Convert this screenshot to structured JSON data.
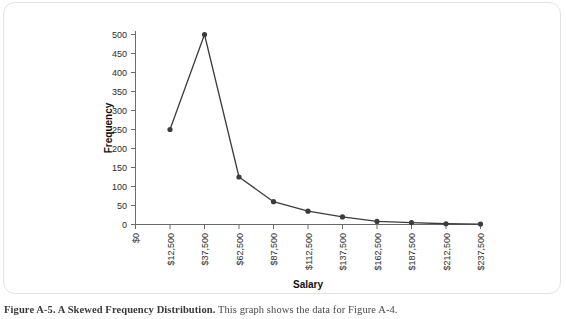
{
  "figure": {
    "caption_label": "Figure A-5.  A Skewed Frequency Distribution.",
    "caption_text": "  This graph shows the data for Figure A-4."
  },
  "chart_data": {
    "type": "line",
    "title": "",
    "xlabel": "Salary",
    "ylabel": "Frequency",
    "categories": [
      "$0",
      "$12,500",
      "$37,500",
      "$62,500",
      "$87,500",
      "$112,500",
      "$137,500",
      "$162,500",
      "$187,500",
      "$212,500",
      "$237,500"
    ],
    "x_tick_labels": [
      "$0",
      "$12,500",
      "$37,500",
      "$62,500",
      "$87,500",
      "$112,500",
      "$137,500",
      "$162,500",
      "$187,500",
      "$212,500",
      "$237,500"
    ],
    "y_tick_labels": [
      "0",
      "50",
      "100",
      "150",
      "200",
      "250",
      "300",
      "350",
      "400",
      "450",
      "500"
    ],
    "y_ticks": [
      0,
      50,
      100,
      150,
      200,
      250,
      300,
      350,
      400,
      450,
      500
    ],
    "ylim": [
      0,
      500
    ],
    "grid": false,
    "legend": false,
    "series": [
      {
        "name": "Frequency",
        "points": [
          {
            "x": "$12,500",
            "y": 250
          },
          {
            "x": "$37,500",
            "y": 500
          },
          {
            "x": "$62,500",
            "y": 125
          },
          {
            "x": "$87,500",
            "y": 60
          },
          {
            "x": "$112,500",
            "y": 35
          },
          {
            "x": "$137,500",
            "y": 20
          },
          {
            "x": "$162,500",
            "y": 8
          },
          {
            "x": "$187,500",
            "y": 5
          },
          {
            "x": "$212,500",
            "y": 2
          },
          {
            "x": "$237,500",
            "y": 1
          }
        ]
      }
    ],
    "line_color": "#3c3c3c",
    "marker_color": "#3c3c3c",
    "axis_color": "#6b6b6b"
  }
}
